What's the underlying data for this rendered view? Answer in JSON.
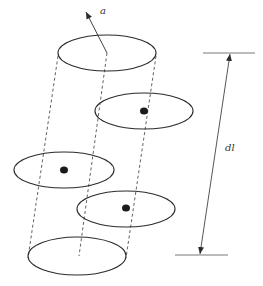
{
  "diagram": {
    "title": "",
    "labels": {
      "axis_vector": "a",
      "length_element": "dl"
    },
    "colors": {
      "stroke": "#2b2b2b",
      "dot": "#1a1a1a",
      "background": "#ffffff"
    },
    "cylinder": {
      "top_ellipse": {
        "cx": 107,
        "cy": 53,
        "rx": 49,
        "ry": 18
      },
      "bottom_ellipse": {
        "cx": 77,
        "cy": 256,
        "rx": 49,
        "ry": 19
      }
    },
    "loops": [
      {
        "cx": 144,
        "cy": 111,
        "rx": 49,
        "ry": 18,
        "dot": {
          "cx": 144,
          "cy": 111
        }
      },
      {
        "cx": 64,
        "cy": 170,
        "rx": 50,
        "ry": 18,
        "dot": {
          "cx": 64,
          "cy": 170
        }
      },
      {
        "cx": 126,
        "cy": 209,
        "rx": 49,
        "ry": 18,
        "dot": {
          "cx": 126,
          "cy": 208
        }
      }
    ],
    "dimension": {
      "top_line": {
        "x1": 203,
        "x2": 255,
        "y": 53
      },
      "bottom_line": {
        "x1": 175,
        "x2": 228,
        "y": 255
      },
      "arrow": {
        "x1": 230,
        "y1": 53,
        "x2": 200,
        "y2": 255
      }
    }
  }
}
